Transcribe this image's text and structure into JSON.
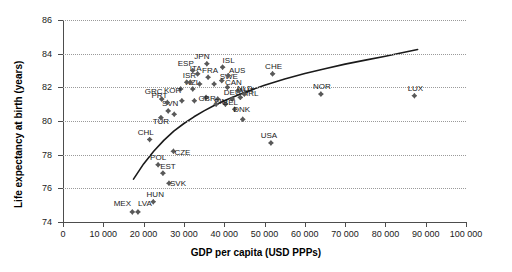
{
  "chart_data": {
    "type": "scatter",
    "title": "",
    "xlabel": "GDP per capita (USD PPPs)",
    "ylabel": "Life expectancy at birth (years)",
    "xlim": [
      0,
      100000
    ],
    "ylim": [
      74,
      86
    ],
    "xticks": [
      0,
      10000,
      20000,
      30000,
      40000,
      50000,
      60000,
      70000,
      80000,
      90000,
      100000
    ],
    "xtick_labels": [
      "0",
      "10 000",
      "20 000",
      "30 000",
      "40 000",
      "50 000",
      "60 000",
      "70 000",
      "80 000",
      "90 000",
      "100 000"
    ],
    "yticks": [
      74,
      76,
      78,
      80,
      82,
      84,
      86
    ],
    "ytick_labels": [
      "74",
      "76",
      "78",
      "80",
      "82",
      "84",
      "86"
    ],
    "grid": "horizontal-dotted",
    "legend": "none",
    "marker": "diamond",
    "marker_color": "#595959",
    "trendline": {
      "style": "solid",
      "color": "#1a1a1a",
      "points": [
        [
          17500,
          76.55
        ],
        [
          20000,
          77.45
        ],
        [
          22500,
          78.2
        ],
        [
          25000,
          78.85
        ],
        [
          27500,
          79.4
        ],
        [
          30000,
          79.85
        ],
        [
          32500,
          80.25
        ],
        [
          35000,
          80.6
        ],
        [
          37500,
          80.92
        ],
        [
          40000,
          81.2
        ],
        [
          45000,
          81.7
        ],
        [
          50000,
          82.12
        ],
        [
          55000,
          82.5
        ],
        [
          60000,
          82.82
        ],
        [
          65000,
          83.1
        ],
        [
          70000,
          83.38
        ],
        [
          75000,
          83.62
        ],
        [
          80000,
          83.85
        ],
        [
          85000,
          84.1
        ],
        [
          88000,
          84.25
        ]
      ]
    },
    "points": [
      {
        "code": "MEX",
        "x": 17200,
        "y": 74.6,
        "label_dx": -10,
        "label_dy": -12
      },
      {
        "code": "LVA",
        "x": 18600,
        "y": 74.6,
        "label_dx": 7,
        "label_dy": -12
      },
      {
        "code": "HUN",
        "x": 22400,
        "y": 75.2,
        "label_dx": 2,
        "label_dy": -11
      },
      {
        "code": "SVK",
        "x": 26300,
        "y": 76.3,
        "label_dx": 9,
        "label_dy": -3
      },
      {
        "code": "EST",
        "x": 24800,
        "y": 76.9,
        "label_dx": 5,
        "label_dy": -10
      },
      {
        "code": "POL",
        "x": 23600,
        "y": 77.4,
        "label_dx": 0,
        "label_dy": -11
      },
      {
        "code": "CZE",
        "x": 27400,
        "y": 78.2,
        "label_dx": 9,
        "label_dy": -2
      },
      {
        "code": "CHL",
        "x": 21500,
        "y": 78.9,
        "label_dx": -4,
        "label_dy": -11
      },
      {
        "code": "TUR",
        "x": 24300,
        "y": 80.2,
        "label_dx": 0,
        "label_dy": 0
      },
      {
        "code": "SVN",
        "x": 26100,
        "y": 80.6,
        "label_dx": 2,
        "label_dy": -11
      },
      {
        "code": "PRT",
        "x": 25900,
        "y": 81.1,
        "label_dx": -8,
        "label_dy": -10
      },
      {
        "code": "GRC",
        "x": 24500,
        "y": 81.3,
        "label_dx": -8,
        "label_dy": -11
      },
      {
        "code": "KOR",
        "x": 29200,
        "y": 81.9,
        "label_dx": -8,
        "label_dy": -2
      },
      {
        "code": "NZL",
        "x": 32200,
        "y": 81.9,
        "label_dx": 0,
        "label_dy": -10
      },
      {
        "code": "ISR",
        "x": 31600,
        "y": 82.3,
        "label_dx": -1,
        "label_dy": -10
      },
      {
        "code": "GBR",
        "x": 35500,
        "y": 81.4,
        "label_dx": 1,
        "label_dy": -2
      },
      {
        "code": "FIN",
        "x": 38400,
        "y": 81.3,
        "label_dx": 3,
        "label_dy": -1
      },
      {
        "code": "DEU",
        "x": 42000,
        "y": 81.3,
        "label_dx": 0,
        "label_dy": -10
      },
      {
        "code": "BEL",
        "x": 40300,
        "y": 81.0,
        "label_dx": 5,
        "label_dy": -5
      },
      {
        "code": "DNK",
        "x": 42600,
        "y": 80.7,
        "label_dx": 7,
        "label_dy": -3
      },
      {
        "code": "AUT",
        "x": 44000,
        "y": 81.4,
        "label_dx": 6,
        "label_dy": -10
      },
      {
        "code": "NLD",
        "x": 43400,
        "y": 81.8,
        "label_dx": 7,
        "label_dy": -6
      },
      {
        "code": "CAN",
        "x": 40800,
        "y": 82.0,
        "label_dx": 6,
        "label_dy": -8
      },
      {
        "code": "SWE",
        "x": 39400,
        "y": 82.4,
        "label_dx": 7,
        "label_dy": -8
      },
      {
        "code": "IRL",
        "x": 45000,
        "y": 81.6,
        "label_dx": 8,
        "label_dy": -4
      },
      {
        "code": "AUS",
        "x": 41000,
        "y": 82.7,
        "label_dx": 9,
        "label_dy": -9
      },
      {
        "code": "FRA",
        "x": 36000,
        "y": 82.6,
        "label_dx": 2,
        "label_dy": -10
      },
      {
        "code": "ITA",
        "x": 33400,
        "y": 82.8,
        "label_dx": -2,
        "label_dy": -9
      },
      {
        "code": "ESP",
        "x": 32200,
        "y": 83.0,
        "label_dx": -7,
        "label_dy": -11
      },
      {
        "code": "JPN",
        "x": 35700,
        "y": 83.4,
        "label_dx": -5,
        "label_dy": -11
      },
      {
        "code": "ISL",
        "x": 39600,
        "y": 83.2,
        "label_dx": 6,
        "label_dy": -10
      },
      {
        "code": "CHE",
        "x": 52000,
        "y": 82.8,
        "label_dx": 1,
        "label_dy": -11
      },
      {
        "code": "USA",
        "x": 51600,
        "y": 78.7,
        "label_dx": -2,
        "label_dy": -11
      },
      {
        "code": "NOR",
        "x": 64000,
        "y": 81.6,
        "label_dx": 1,
        "label_dy": -11
      },
      {
        "code": "LUX",
        "x": 87200,
        "y": 81.5,
        "label_dx": 1,
        "label_dy": -11
      },
      {
        "code": "",
        "x": 30700,
        "y": 82.3,
        "label_dx": 0,
        "label_dy": 0
      },
      {
        "code": "",
        "x": 33900,
        "y": 82.2,
        "label_dx": 0,
        "label_dy": 0
      },
      {
        "code": "",
        "x": 37500,
        "y": 82.2,
        "label_dx": 0,
        "label_dy": 0
      },
      {
        "code": "",
        "x": 38000,
        "y": 81.0,
        "label_dx": 0,
        "label_dy": 0
      },
      {
        "code": "",
        "x": 32600,
        "y": 81.2,
        "label_dx": 0,
        "label_dy": 0
      },
      {
        "code": "",
        "x": 29500,
        "y": 81.2,
        "label_dx": 0,
        "label_dy": 0
      },
      {
        "code": "",
        "x": 27600,
        "y": 80.4,
        "label_dx": 0,
        "label_dy": 0
      },
      {
        "code": "",
        "x": 44600,
        "y": 80.1,
        "label_dx": 0,
        "label_dy": 0
      }
    ]
  }
}
